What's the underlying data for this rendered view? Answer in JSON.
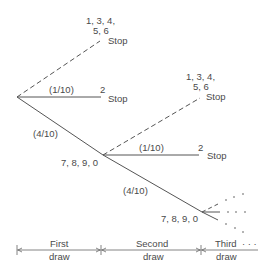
{
  "diagram": {
    "type": "probability-tree",
    "root": {
      "branches": [
        {
          "style": "dashed",
          "outcomes_line1": "1, 3, 4,",
          "outcomes_line2": "5, 6",
          "result": "Stop"
        },
        {
          "style": "solid",
          "probability": "(1/10)",
          "outcome": "2",
          "result": "Stop"
        },
        {
          "style": "solid",
          "probability": "(4/10)",
          "outcomes": "7, 8, 9, 0"
        }
      ]
    },
    "second_node": {
      "branches": [
        {
          "style": "dashed",
          "outcomes_line1": "1, 3, 4,",
          "outcomes_line2": "5, 6",
          "result": "Stop"
        },
        {
          "style": "solid",
          "probability": "(1/10)",
          "outcome": "2",
          "result": "Stop"
        },
        {
          "style": "solid",
          "probability": "(4/10)",
          "outcomes": "7, 8, 9, 0"
        }
      ]
    },
    "third_node": {
      "continuation": "· · ·"
    },
    "stages": [
      {
        "line1": "First",
        "line2": "draw"
      },
      {
        "line1": "Second",
        "line2": "draw"
      },
      {
        "line1": "Third",
        "line2": "draw",
        "continuation": "· · ·"
      }
    ]
  }
}
